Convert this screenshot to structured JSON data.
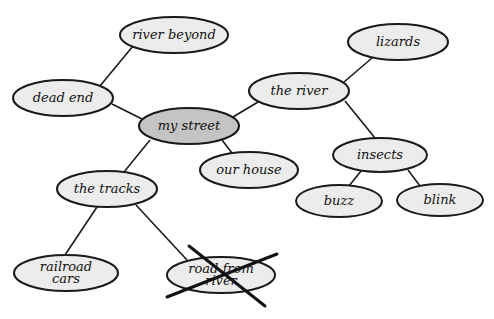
{
  "diagram": {
    "type": "concept-map",
    "center": "my street",
    "nodes": [
      {
        "id": "river_beyond",
        "label": "river beyond",
        "cx": 174,
        "cy": 35,
        "rx": 54,
        "ry": 18,
        "lines": [
          "river beyond"
        ]
      },
      {
        "id": "dead_end",
        "label": "dead end",
        "cx": 63,
        "cy": 98,
        "rx": 50,
        "ry": 18,
        "lines": [
          "dead end"
        ]
      },
      {
        "id": "my_street",
        "label": "my street",
        "cx": 189,
        "cy": 126,
        "rx": 50,
        "ry": 18,
        "lines": [
          "my street"
        ],
        "center": true
      },
      {
        "id": "the_river",
        "label": "the river",
        "cx": 299,
        "cy": 91,
        "rx": 50,
        "ry": 18,
        "lines": [
          "the river"
        ]
      },
      {
        "id": "lizards",
        "label": "lizards",
        "cx": 398,
        "cy": 42,
        "rx": 50,
        "ry": 18,
        "lines": [
          "lizards"
        ]
      },
      {
        "id": "our_house",
        "label": "our house",
        "cx": 249,
        "cy": 170,
        "rx": 49,
        "ry": 18,
        "lines": [
          "our house"
        ]
      },
      {
        "id": "insects",
        "label": "insects",
        "cx": 380,
        "cy": 155,
        "rx": 47,
        "ry": 17,
        "lines": [
          "insects"
        ]
      },
      {
        "id": "buzz",
        "label": "buzz",
        "cx": 339,
        "cy": 201,
        "rx": 43,
        "ry": 16,
        "lines": [
          "buzz"
        ]
      },
      {
        "id": "blink",
        "label": "blink",
        "cx": 440,
        "cy": 200,
        "rx": 43,
        "ry": 16,
        "lines": [
          "blink"
        ]
      },
      {
        "id": "the_tracks",
        "label": "the tracks",
        "cx": 107,
        "cy": 189,
        "rx": 50,
        "ry": 18,
        "lines": [
          "the tracks"
        ]
      },
      {
        "id": "railroad_cars",
        "label": "railroad cars",
        "cx": 66,
        "cy": 273,
        "rx": 52,
        "ry": 18,
        "lines": [
          "railroad",
          "cars"
        ]
      },
      {
        "id": "road_from_river",
        "label": "road from river",
        "cx": 221,
        "cy": 275,
        "rx": 54,
        "ry": 18,
        "lines": [
          "road from",
          "river"
        ],
        "crossed_out": true
      }
    ],
    "edges": [
      {
        "from": "river_beyond",
        "to": "dead_end"
      },
      {
        "from": "dead_end",
        "to": "my_street"
      },
      {
        "from": "my_street",
        "to": "the_river"
      },
      {
        "from": "the_river",
        "to": "lizards"
      },
      {
        "from": "the_river",
        "to": "insects"
      },
      {
        "from": "insects",
        "to": "buzz"
      },
      {
        "from": "insects",
        "to": "blink"
      },
      {
        "from": "my_street",
        "to": "our_house"
      },
      {
        "from": "my_street",
        "to": "the_tracks"
      },
      {
        "from": "the_tracks",
        "to": "railroad_cars"
      },
      {
        "from": "the_tracks",
        "to": "road_from_river"
      }
    ],
    "cross_out": {
      "target": "road_from_river",
      "lines": [
        [
          189,
          246,
          265,
          306
        ],
        [
          167,
          297,
          277,
          254
        ]
      ]
    },
    "colors": {
      "node_fill": "#ececec",
      "center_fill": "#c4c4c4",
      "stroke": "#1a1a1a"
    }
  }
}
